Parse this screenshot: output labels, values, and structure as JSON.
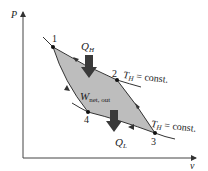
{
  "diagram": {
    "type": "Carnot cycle P-v diagram",
    "axes": {
      "y_label": "P",
      "x_label": "v"
    },
    "states": [
      {
        "id": "1",
        "label": "1"
      },
      {
        "id": "2",
        "label": "2"
      },
      {
        "id": "3",
        "label": "3"
      },
      {
        "id": "4",
        "label": "4"
      }
    ],
    "annotations": {
      "heat_in": {
        "main": "Q",
        "sub": "H"
      },
      "heat_out": {
        "main": "Q",
        "sub": "L"
      },
      "work": {
        "main": "W",
        "sub": "net, out"
      },
      "upper_isotherm": {
        "main": "T",
        "sub": "H",
        "rest": " = const."
      },
      "lower_isotherm": {
        "main": "T",
        "sub": "H",
        "rest": " = const."
      }
    },
    "colors": {
      "fill": "#bdbdbd",
      "line": "#333333",
      "arrow": "#3a3a3a"
    }
  }
}
